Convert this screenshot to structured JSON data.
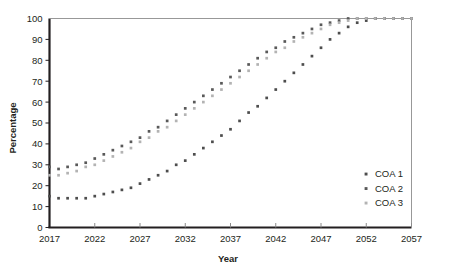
{
  "chart_data": {
    "type": "scatter",
    "title": "",
    "xlabel": "Year",
    "ylabel": "Percentage",
    "xlim": [
      2017,
      2057
    ],
    "ylim": [
      0,
      100
    ],
    "grid": false,
    "legend_position": "right-inside",
    "xticks": [
      2017,
      2022,
      2027,
      2032,
      2037,
      2042,
      2047,
      2052,
      2057
    ],
    "xtick_labels": [
      "2017",
      "2022",
      "2027",
      "2032",
      "2037",
      "2042",
      "2047",
      "2052",
      "2057"
    ],
    "yticks": [
      0,
      10,
      20,
      30,
      40,
      50,
      60,
      70,
      80,
      90,
      100
    ],
    "ytick_labels": [
      "0",
      "10",
      "20",
      "30",
      "40",
      "50",
      "60",
      "70",
      "80",
      "90",
      "100"
    ],
    "x": [
      2017,
      2018,
      2019,
      2020,
      2021,
      2022,
      2023,
      2024,
      2025,
      2026,
      2027,
      2028,
      2029,
      2030,
      2031,
      2032,
      2033,
      2034,
      2035,
      2036,
      2037,
      2038,
      2039,
      2040,
      2041,
      2042,
      2043,
      2044,
      2045,
      2046,
      2047,
      2048,
      2049,
      2050,
      2051,
      2052,
      2053,
      2054,
      2055,
      2056,
      2057
    ],
    "series": [
      {
        "name": "COA 1",
        "color": "#4d4d4d",
        "values": [
          15,
          14,
          14,
          14,
          14,
          15,
          16,
          17,
          18,
          19,
          21,
          23,
          25,
          27,
          30,
          32,
          35,
          38,
          41,
          44,
          47,
          51,
          55,
          58,
          62,
          66,
          70,
          74,
          78,
          82,
          86,
          90,
          93,
          96,
          98,
          99,
          100,
          100,
          100,
          100,
          100
        ]
      },
      {
        "name": "COA 2",
        "color": "#595959",
        "values": [
          29,
          28,
          29,
          30,
          31,
          33,
          35,
          37,
          39,
          41,
          43,
          46,
          48,
          51,
          54,
          57,
          60,
          63,
          66,
          69,
          72,
          75,
          78,
          81,
          84,
          86,
          89,
          91,
          93,
          95,
          97,
          98,
          99,
          100,
          100,
          100,
          100,
          100,
          100,
          100,
          100
        ]
      },
      {
        "name": "COA 3",
        "color": "#b3b3b3",
        "values": [
          25,
          25,
          26,
          27,
          29,
          30,
          32,
          34,
          36,
          38,
          41,
          43,
          46,
          48,
          51,
          54,
          57,
          60,
          63,
          66,
          69,
          72,
          75,
          78,
          81,
          84,
          86,
          89,
          91,
          93,
          95,
          97,
          98,
          99,
          100,
          100,
          100,
          100,
          100,
          100,
          100
        ]
      }
    ]
  },
  "legend": {
    "items": [
      {
        "label": "COA 1",
        "color": "#4d4d4d"
      },
      {
        "label": "COA 2",
        "color": "#595959"
      },
      {
        "label": "COA 3",
        "color": "#b3b3b3"
      }
    ]
  },
  "axes": {
    "x_title": "Year",
    "y_title": "Percentage"
  }
}
